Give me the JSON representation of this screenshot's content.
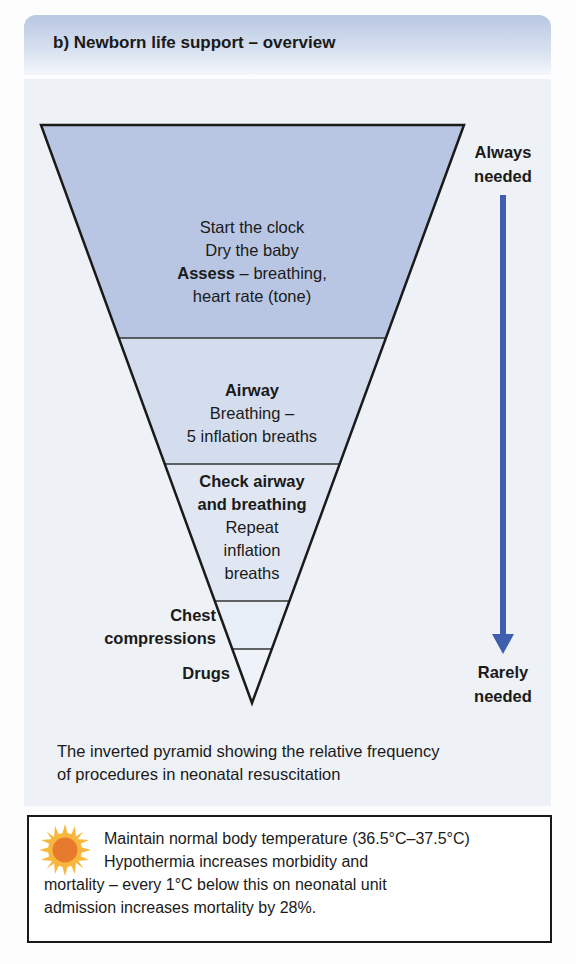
{
  "header": {
    "title": "b) Newborn life support – overview"
  },
  "pyramid": {
    "tiers": [
      {
        "lines": [
          "Start the clock",
          "Dry the baby"
        ],
        "bold_lead": "Assess",
        "lead_rest": " – breathing,",
        "last_line": "heart rate (tone)",
        "fill": "#b8c6e3"
      },
      {
        "title": "Airway",
        "lines": [
          "Breathing –",
          "5 inflation breaths"
        ],
        "fill": "#d3ddef"
      },
      {
        "title_lines": [
          "Check airway",
          "and breathing"
        ],
        "lines": [
          "Repeat",
          "inflation",
          "breaths"
        ],
        "fill": "#e2e9f5"
      },
      {
        "side_label_lines": [
          "Chest",
          "compressions"
        ],
        "fill": "#eaf0f8"
      },
      {
        "side_label_lines": [
          "Drugs"
        ],
        "fill": "#f0f4fa"
      }
    ],
    "axis": {
      "top_label_lines": [
        "Always",
        "needed"
      ],
      "bottom_label_lines": [
        "Rarely",
        "needed"
      ],
      "arrow_color": "#3f5fae"
    }
  },
  "caption": {
    "lines": [
      "The inverted pyramid showing the relative frequency",
      "of procedures in neonatal resuscitation"
    ]
  },
  "note": {
    "icon": "sun-icon",
    "line1": "Maintain normal body temperature (36.5°C–37.5°C)",
    "line2": "Hypothermia increases morbidity and",
    "line3": "mortality – every 1°C below this on neonatal unit",
    "line4": "admission increases mortality by 28%."
  }
}
